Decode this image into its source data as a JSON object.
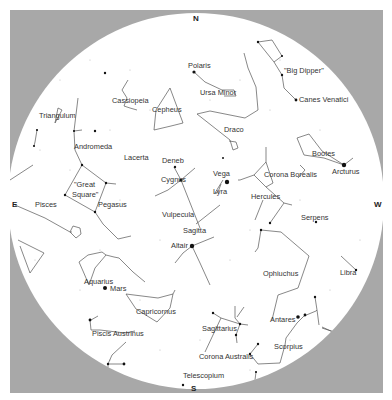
{
  "chart": {
    "title": "",
    "type": "sky-map",
    "colors": {
      "frame": "#a8a8a8",
      "sky": "#ffffff",
      "lines": "#555555",
      "stars": "#111111",
      "labels": "#333333"
    },
    "directions": {
      "north": "N",
      "south": "S",
      "east": "E",
      "west": "W"
    },
    "labels": {
      "polaris": "Polaris",
      "big_dipper": "\"Big Dipper\"",
      "ursa_minor": "Ursa Minor",
      "canes_venatici": "Canes Venatici",
      "cassiopeia": "Cassiopeia",
      "cepheus": "Cepheus",
      "triangulum": "Triangulum",
      "draco": "Draco",
      "andromeda": "Andromeda",
      "lacerta": "Lacerta",
      "deneb": "Deneb",
      "cygnus": "Cygnus",
      "vega": "Vega",
      "lyra": "Lyra",
      "corona_borealis": "Corona Borealis",
      "bootes": "Bootes",
      "arcturus": "Arcturus",
      "great_square_1": "\"Great",
      "great_square_2": "Square\"",
      "pegasus": "Pegasus",
      "pisces": "Pisces",
      "hercules": "Hercules",
      "vulpecula": "Vulpecula",
      "serpens": "Serpens",
      "sagitta": "Sagitta",
      "altair": "Altair",
      "ophiuchus": "Ophiuchus",
      "libra": "Libra",
      "aquarius": "Aquarius",
      "mars": "Mars",
      "capricornus": "Capricornus",
      "antares": "Antares",
      "sagittarius": "Sagittarius",
      "piscis_austrinus": "Piscis Austrinus",
      "scorpius": "Scorpius",
      "corona_australis": "Corona Australis",
      "telescopium": "Telescopium"
    }
  }
}
